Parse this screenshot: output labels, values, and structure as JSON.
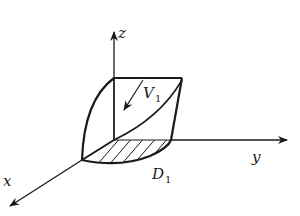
{
  "figure": {
    "type": "3d-region-diagram",
    "axes": {
      "x_label": "x",
      "y_label": "y",
      "z_label": "z"
    },
    "region_label": {
      "main": "V",
      "sub": "1"
    },
    "domain_label": {
      "main": "D",
      "sub": "1"
    },
    "colors": {
      "stroke": "#1a1a1a",
      "background": "#ffffff"
    }
  }
}
